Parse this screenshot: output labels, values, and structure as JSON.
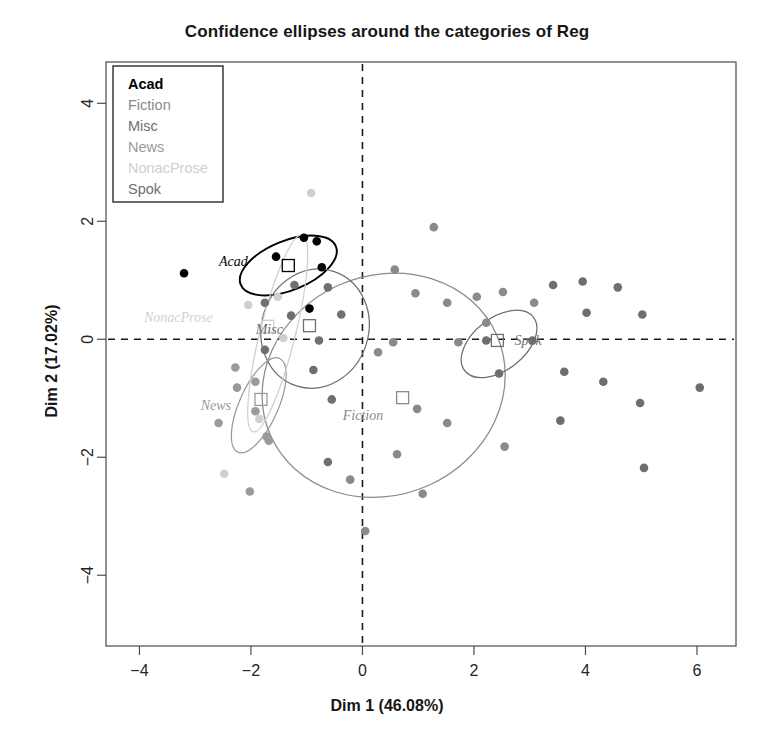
{
  "chart_data": {
    "type": "scatter",
    "title": "Confidence ellipses around the categories of Reg",
    "xlabel": "Dim 1 (46.08%)",
    "ylabel": "Dim 2 (17.02%)",
    "xlim": [
      -4.6,
      6.7
    ],
    "ylim": [
      -5.2,
      4.7
    ],
    "xticks": [
      -4,
      -2,
      0,
      2,
      4,
      6
    ],
    "yticks": [
      -4,
      -2,
      0,
      2,
      4
    ],
    "xtick_labels": [
      "−4",
      "−2",
      "0",
      "2",
      "4",
      "6"
    ],
    "ytick_labels": [
      "−4",
      "−2",
      "0",
      "2",
      "4"
    ],
    "grid": false,
    "reference_lines": {
      "x": 0,
      "y": 0,
      "style": "dashed"
    },
    "legend": {
      "position": "top-left",
      "boxed": true,
      "entries": [
        {
          "label": "Acad",
          "color": "#000000"
        },
        {
          "label": "Fiction",
          "color": "#8a8a8a"
        },
        {
          "label": "Misc",
          "color": "#707070"
        },
        {
          "label": "News",
          "color": "#9a9a9a"
        },
        {
          "label": "NonacProse",
          "color": "#cfcfcf"
        },
        {
          "label": "Spok",
          "color": "#6e6e6e"
        }
      ]
    },
    "groups": [
      {
        "name": "Acad",
        "color": "#000000",
        "centroid": [
          -1.33,
          1.25
        ],
        "ellipse": {
          "cx": -1.33,
          "cy": 1.25,
          "rx": 0.92,
          "ry": 0.42,
          "angle": -22
        },
        "label_pos": [
          -1.95,
          1.33
        ],
        "points": [
          [
            -1.05,
            1.72
          ],
          [
            -0.82,
            1.66
          ],
          [
            -0.73,
            1.22
          ],
          [
            -1.55,
            1.4
          ],
          [
            -3.2,
            1.12
          ],
          [
            -0.95,
            0.52
          ]
        ]
      },
      {
        "name": "Fiction",
        "color": "#8a8a8a",
        "centroid": [
          0.72,
          -0.99
        ],
        "ellipse": {
          "cx": 0.38,
          "cy": -0.78,
          "rx": 2.22,
          "ry": 1.86,
          "angle": -24
        },
        "label_pos": [
          0.48,
          -1.28
        ],
        "points": [
          [
            1.28,
            1.9
          ],
          [
            0.58,
            1.18
          ],
          [
            0.95,
            0.78
          ],
          [
            1.52,
            0.62
          ],
          [
            2.05,
            0.72
          ],
          [
            2.52,
            0.8
          ],
          [
            3.08,
            0.62
          ],
          [
            2.22,
            0.28
          ],
          [
            0.55,
            -0.05
          ],
          [
            1.72,
            -0.05
          ],
          [
            0.28,
            -0.22
          ],
          [
            0.98,
            -1.18
          ],
          [
            1.52,
            -1.42
          ],
          [
            0.62,
            -1.95
          ],
          [
            2.55,
            -1.82
          ],
          [
            -0.22,
            -2.38
          ],
          [
            1.08,
            -2.62
          ],
          [
            0.05,
            -3.25
          ]
        ]
      },
      {
        "name": "Misc",
        "color": "#707070",
        "centroid": [
          -0.95,
          0.23
        ],
        "ellipse": {
          "cx": -0.85,
          "cy": 0.18,
          "rx": 0.96,
          "ry": 1.02,
          "angle": 18
        },
        "label_pos": [
          -1.32,
          0.18
        ],
        "points": [
          [
            -1.22,
            0.92
          ],
          [
            -0.62,
            0.88
          ],
          [
            -1.75,
            0.62
          ],
          [
            -1.28,
            0.4
          ],
          [
            -0.38,
            0.42
          ],
          [
            -0.78,
            -0.02
          ],
          [
            -1.75,
            -0.18
          ],
          [
            -0.88,
            -0.52
          ],
          [
            -0.55,
            -1.02
          ],
          [
            -0.62,
            -2.08
          ]
        ]
      },
      {
        "name": "News",
        "color": "#9a9a9a",
        "centroid": [
          -1.82,
          -1.02
        ],
        "ellipse": {
          "cx": -1.86,
          "cy": -1.12,
          "rx": 0.92,
          "ry": 0.33,
          "angle": -66
        },
        "label_pos": [
          -2.25,
          -1.12
        ],
        "points": [
          [
            -2.28,
            -0.48
          ],
          [
            -2.25,
            -0.82
          ],
          [
            -1.92,
            -0.72
          ],
          [
            -1.92,
            -1.22
          ],
          [
            -1.72,
            -1.65
          ],
          [
            -1.68,
            -1.72
          ],
          [
            -2.58,
            -1.42
          ],
          [
            -2.02,
            -2.58
          ]
        ]
      },
      {
        "name": "NonacProse",
        "color": "#cfcfcf",
        "centroid": [
          -1.7,
          0.22
        ],
        "ellipse": {
          "cx": -1.52,
          "cy": 0.1,
          "rx": 1.82,
          "ry": 0.3,
          "angle": -76
        },
        "label_pos": [
          -2.58,
          0.38
        ],
        "points": [
          [
            -0.92,
            2.48
          ],
          [
            -1.52,
            0.72
          ],
          [
            -2.05,
            0.58
          ],
          [
            -1.42,
            0.02
          ],
          [
            -1.85,
            -1.35
          ],
          [
            -2.48,
            -2.28
          ]
        ]
      },
      {
        "name": "Spok",
        "color": "#6e6e6e",
        "centroid": [
          2.42,
          -0.02
        ],
        "ellipse": {
          "cx": 2.45,
          "cy": -0.08,
          "rx": 0.78,
          "ry": 0.44,
          "angle": -38
        },
        "label_pos": [
          2.62,
          -0.02
        ],
        "points": [
          [
            2.22,
            -0.02
          ],
          [
            3.05,
            -0.02
          ],
          [
            3.42,
            0.92
          ],
          [
            3.95,
            0.98
          ],
          [
            4.58,
            0.88
          ],
          [
            4.02,
            0.45
          ],
          [
            5.02,
            0.42
          ],
          [
            3.62,
            -0.55
          ],
          [
            2.45,
            -0.58
          ],
          [
            4.32,
            -0.72
          ],
          [
            4.98,
            -1.08
          ],
          [
            3.55,
            -1.38
          ],
          [
            5.05,
            -2.18
          ],
          [
            6.05,
            -0.82
          ]
        ]
      }
    ],
    "centroid_marker": "open-square"
  }
}
